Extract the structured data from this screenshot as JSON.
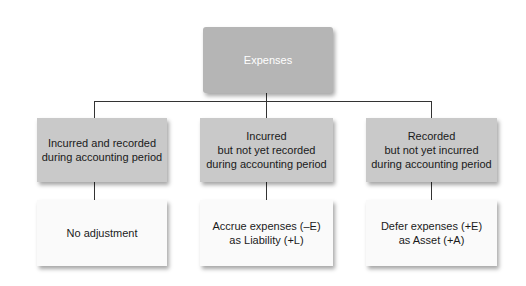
{
  "diagram": {
    "root": {
      "label": "Expenses"
    },
    "categories": [
      {
        "label": "Incurred and recorded\nduring accounting period",
        "outcome": "No adjustment"
      },
      {
        "label": "Incurred\nbut not yet recorded\nduring accounting period",
        "outcome": "Accrue expenses (–E)\nas Liability  (+L)"
      },
      {
        "label": "Recorded\nbut not yet incurred\nduring accounting period",
        "outcome": "Defer expenses (+E)\nas Asset (+A)"
      }
    ],
    "colors": {
      "root_fill": "#b5b5b5",
      "root_text": "#ffffff",
      "category_fill": "#c9c9c9",
      "outcome_fill": "#fafafa",
      "connector": "#333333"
    }
  }
}
